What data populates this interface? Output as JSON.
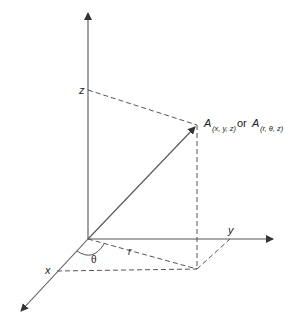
{
  "diagram": {
    "type": "3d-coordinate-system",
    "colors": {
      "line": "#444444",
      "text": "#222222",
      "background": "#ffffff"
    },
    "axes": {
      "z": {
        "label": "z"
      },
      "y": {
        "label": "y"
      },
      "x": {
        "label": "x"
      }
    },
    "point": {
      "name": "A",
      "cartesian_sub": "(x, y, z)",
      "connector": "or",
      "cylindrical_sub": "(r, θ, z)"
    },
    "labels": {
      "radius": "r",
      "angle": "θ"
    }
  }
}
